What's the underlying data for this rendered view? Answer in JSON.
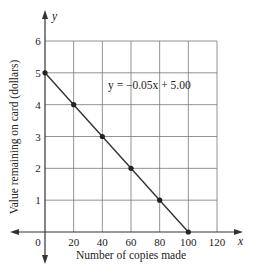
{
  "chart_data": {
    "type": "line",
    "title": "",
    "xlabel": "Number of copies made",
    "ylabel": "Value remaining on card (dollars)",
    "x_axis_symbol": "x",
    "y_axis_symbol": "y",
    "xlim": [
      0,
      120
    ],
    "ylim": [
      0,
      6
    ],
    "x_ticks": [
      "0",
      "20",
      "40",
      "60",
      "80",
      "100",
      "120"
    ],
    "y_ticks": [
      "1",
      "2",
      "3",
      "4",
      "5",
      "6"
    ],
    "grid": true,
    "equation_label": "y = −0.05x + 5.00",
    "series": [
      {
        "name": "y = -0.05x + 5.00",
        "x": [
          0,
          20,
          40,
          60,
          80,
          100
        ],
        "y": [
          5,
          4,
          3,
          2,
          1,
          0
        ]
      }
    ]
  }
}
